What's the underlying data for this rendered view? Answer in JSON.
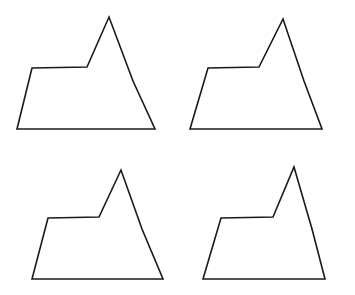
{
  "figure": {
    "background_color": "#ffffff",
    "stroke_color": "#1a1a1a",
    "stroke_width": 1.6,
    "fill": "none",
    "width": 355,
    "height": 295,
    "layout": {
      "rows": 2,
      "columns": 2,
      "count": 4
    },
    "shapes": [
      {
        "name": "mountain-polygon-top-left",
        "position": "top-left",
        "vertex_count": 6,
        "points": "17,129 32,68 87,67 109,17 133,81 155,129",
        "vertices": [
          {
            "label": "bottom-left",
            "x": 17,
            "y": 129
          },
          {
            "label": "left-shoulder",
            "x": 32,
            "y": 68
          },
          {
            "label": "shoulder-right",
            "x": 87,
            "y": 67
          },
          {
            "label": "peak",
            "x": 109,
            "y": 17
          },
          {
            "label": "right-slope",
            "x": 133,
            "y": 81
          },
          {
            "label": "bottom-right",
            "x": 155,
            "y": 129
          }
        ]
      },
      {
        "name": "mountain-polygon-top-right",
        "position": "top-right",
        "vertex_count": 6,
        "points": "190,129 208,68 259,67 283,19 304,81 322,129",
        "vertices": [
          {
            "label": "bottom-left",
            "x": 190,
            "y": 129
          },
          {
            "label": "left-shoulder",
            "x": 208,
            "y": 68
          },
          {
            "label": "shoulder-right",
            "x": 259,
            "y": 67
          },
          {
            "label": "peak",
            "x": 283,
            "y": 19
          },
          {
            "label": "right-slope",
            "x": 304,
            "y": 81
          },
          {
            "label": "bottom-right",
            "x": 322,
            "y": 129
          }
        ]
      },
      {
        "name": "mountain-polygon-bottom-left",
        "position": "bottom-left",
        "vertex_count": 6,
        "points": "32,279 48,218 99,217 121,170 142,229 163,279",
        "vertices": [
          {
            "label": "bottom-left",
            "x": 32,
            "y": 279
          },
          {
            "label": "left-shoulder",
            "x": 48,
            "y": 218
          },
          {
            "label": "shoulder-right",
            "x": 99,
            "y": 217
          },
          {
            "label": "peak",
            "x": 121,
            "y": 170
          },
          {
            "label": "right-slope",
            "x": 142,
            "y": 229
          },
          {
            "label": "bottom-right",
            "x": 163,
            "y": 279
          }
        ]
      },
      {
        "name": "mountain-polygon-bottom-right",
        "position": "bottom-right",
        "vertex_count": 6,
        "points": "203,279 221,218 273,217 294,167 312,229 325,279",
        "vertices": [
          {
            "label": "bottom-left",
            "x": 203,
            "y": 279
          },
          {
            "label": "left-shoulder",
            "x": 221,
            "y": 218
          },
          {
            "label": "shoulder-right",
            "x": 273,
            "y": 217
          },
          {
            "label": "peak",
            "x": 294,
            "y": 167
          },
          {
            "label": "right-slope",
            "x": 312,
            "y": 229
          },
          {
            "label": "bottom-right",
            "x": 325,
            "y": 279
          }
        ]
      }
    ]
  }
}
